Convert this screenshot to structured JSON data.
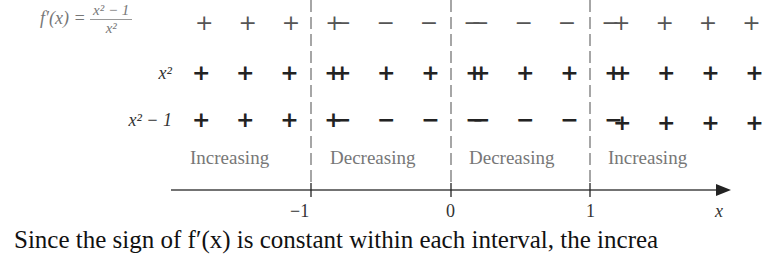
{
  "rows": [
    {
      "label_prefix": "f′(x) =",
      "num": "x² − 1",
      "den": "x²",
      "signs": [
        "+ + + +",
        "− − − −",
        "− − − −",
        "+ + + +"
      ]
    },
    {
      "label": "x²",
      "signs": [
        "+ + + +",
        "+ + + +",
        "+ + + +",
        "+ + + +"
      ]
    },
    {
      "label": "x² − 1",
      "signs": [
        "+ + + +",
        "− − − −",
        "− − − −",
        "+ + + +"
      ]
    }
  ],
  "intervals": [
    "Increasing",
    "Decreasing",
    "Decreasing",
    "Increasing"
  ],
  "axis": {
    "ticks": [
      "−1",
      "0",
      "1"
    ],
    "label": "x"
  },
  "caption": "Since the sign of f′(x) is constant within each interval, the increa"
}
